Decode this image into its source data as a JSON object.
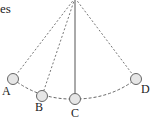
{
  "diagram": {
    "title_fragment": "es",
    "pivot": {
      "x": 75,
      "y": -2
    },
    "positions": [
      {
        "label": "A",
        "x": 13,
        "y": 79,
        "lx": 6,
        "ly": 95,
        "string": "dashed"
      },
      {
        "label": "B",
        "x": 42,
        "y": 96,
        "lx": 38,
        "ly": 110,
        "string": "dashed"
      },
      {
        "label": "C",
        "x": 75,
        "y": 99,
        "lx": 72,
        "ly": 116,
        "string": "solid"
      },
      {
        "label": "D",
        "x": 136,
        "y": 79,
        "lx": 142,
        "ly": 93,
        "string": "dashed"
      }
    ],
    "colors": {
      "line": "#555555",
      "bob_fill": "#e6e6e6",
      "bob_stroke": "#666666"
    }
  }
}
